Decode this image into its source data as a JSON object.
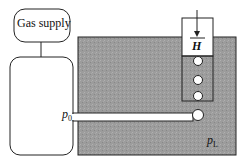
{
  "diagram": {
    "supply_label": "Gas supply",
    "column_label": "H",
    "inlet_pressure_label": "p",
    "inlet_pressure_sub": "0",
    "liquid_pressure_label": "p",
    "liquid_pressure_sub": "L",
    "colors": {
      "liquid": "#9a9a9a",
      "outline": "#222222",
      "background": "#ffffff"
    }
  }
}
